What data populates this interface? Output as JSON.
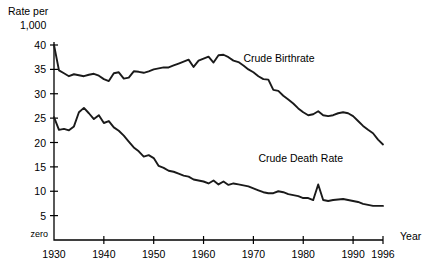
{
  "chart_data": {
    "type": "line",
    "title": "",
    "xlabel": "Year",
    "ylabel": "Rate per 1,000",
    "ylabel_line1": "Rate per",
    "ylabel_line2": "1,000",
    "grid": false,
    "legend_position": "inline-annotation",
    "xlim": [
      1930,
      1996
    ],
    "ylim": [
      0,
      40
    ],
    "yticks": [
      5,
      10,
      15,
      20,
      25,
      30,
      35,
      40
    ],
    "ytick_labels": [
      "5",
      "10",
      "15",
      "20",
      "25",
      "30",
      "35",
      "40"
    ],
    "zero_label": "zero",
    "xticks": [
      1930,
      1940,
      1950,
      1960,
      1970,
      1980,
      1990,
      1996
    ],
    "xtick_labels": [
      "1930",
      "1940",
      "1950",
      "1960",
      "1970",
      "1980",
      "1990",
      "1996"
    ],
    "annotations": [
      {
        "text": "Crude Birthrate",
        "x": 1968,
        "y": 36.5
      },
      {
        "text": "Crude Death Rate",
        "x": 1971,
        "y": 16.0
      }
    ],
    "series": [
      {
        "name": "Crude Birthrate",
        "x": [
          1930,
          1931,
          1932,
          1933,
          1934,
          1935,
          1936,
          1937,
          1938,
          1939,
          1940,
          1941,
          1942,
          1943,
          1944,
          1945,
          1946,
          1947,
          1948,
          1949,
          1950,
          1951,
          1952,
          1953,
          1954,
          1955,
          1956,
          1957,
          1958,
          1959,
          1960,
          1961,
          1962,
          1963,
          1964,
          1965,
          1966,
          1967,
          1968,
          1969,
          1970,
          1971,
          1972,
          1973,
          1974,
          1975,
          1976,
          1977,
          1978,
          1979,
          1980,
          1981,
          1982,
          1983,
          1984,
          1985,
          1986,
          1987,
          1988,
          1989,
          1990,
          1991,
          1992,
          1993,
          1994,
          1995,
          1996
        ],
        "values": [
          40.0,
          34.8,
          34.2,
          33.6,
          34.0,
          33.8,
          33.6,
          33.9,
          34.1,
          33.7,
          33.0,
          32.6,
          34.2,
          34.4,
          33.1,
          33.3,
          34.6,
          34.5,
          34.3,
          34.6,
          35.0,
          35.2,
          35.4,
          35.4,
          35.8,
          36.2,
          36.6,
          37.0,
          35.5,
          36.8,
          37.2,
          37.6,
          36.4,
          37.9,
          38.0,
          37.5,
          36.8,
          36.5,
          35.8,
          35.0,
          34.4,
          33.6,
          33.0,
          32.9,
          30.8,
          30.6,
          29.6,
          28.8,
          28.0,
          27.0,
          26.2,
          25.6,
          25.8,
          26.4,
          25.6,
          25.4,
          25.6,
          26.0,
          26.2,
          26.0,
          25.4,
          24.4,
          23.4,
          22.6,
          21.9,
          20.6,
          19.6
        ]
      },
      {
        "name": "Crude Death Rate",
        "x": [
          1930,
          1931,
          1932,
          1933,
          1934,
          1935,
          1936,
          1937,
          1938,
          1939,
          1940,
          1941,
          1942,
          1943,
          1944,
          1945,
          1946,
          1947,
          1948,
          1949,
          1950,
          1951,
          1952,
          1953,
          1954,
          1955,
          1956,
          1957,
          1958,
          1959,
          1960,
          1961,
          1962,
          1963,
          1964,
          1965,
          1966,
          1967,
          1968,
          1969,
          1970,
          1971,
          1972,
          1973,
          1974,
          1975,
          1976,
          1977,
          1978,
          1979,
          1980,
          1981,
          1982,
          1983,
          1984,
          1985,
          1986,
          1987,
          1988,
          1989,
          1990,
          1991,
          1992,
          1993,
          1994,
          1995,
          1996
        ],
        "values": [
          25.2,
          22.6,
          22.8,
          22.5,
          23.3,
          26.2,
          27.1,
          26.0,
          24.8,
          25.6,
          24.0,
          24.4,
          23.1,
          22.4,
          21.4,
          20.2,
          19.0,
          18.2,
          17.1,
          17.4,
          16.8,
          15.2,
          14.8,
          14.2,
          14.0,
          13.6,
          13.2,
          13.0,
          12.4,
          12.2,
          12.0,
          11.6,
          12.2,
          11.4,
          12.0,
          11.3,
          11.6,
          11.4,
          11.2,
          11.0,
          10.6,
          10.2,
          9.8,
          9.6,
          9.6,
          10.0,
          9.8,
          9.4,
          9.2,
          9.0,
          8.6,
          8.6,
          8.2,
          11.4,
          8.2,
          8.0,
          8.2,
          8.3,
          8.4,
          8.2,
          8.0,
          7.8,
          7.4,
          7.2,
          7.0,
          7.0,
          7.0
        ]
      }
    ]
  }
}
